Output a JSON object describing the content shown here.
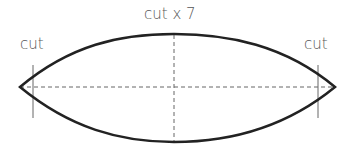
{
  "diagram": {
    "title_label": "cut x 7",
    "left_label": "cut",
    "right_label": "cut",
    "colors": {
      "outline": "#222222",
      "guides": "#666666",
      "text": "#555555"
    }
  }
}
